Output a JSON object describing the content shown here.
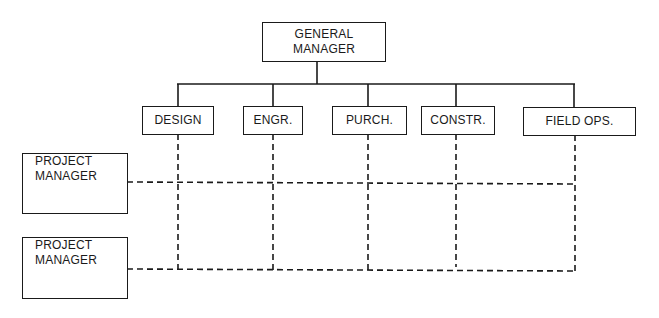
{
  "diagram": {
    "type": "matrix-organization-chart",
    "top": {
      "line1": "GENERAL",
      "line2": "MANAGER"
    },
    "departments": [
      {
        "label": "DESIGN"
      },
      {
        "label": "ENGR."
      },
      {
        "label": "PURCH."
      },
      {
        "label": "CONSTR."
      },
      {
        "label": "FIELD OPS."
      }
    ],
    "projects": [
      {
        "line1": "PROJECT",
        "line2": "MANAGER"
      },
      {
        "line1": "PROJECT",
        "line2": "MANAGER"
      }
    ],
    "colors": {
      "line": "#1a1a1a",
      "background": "#ffffff"
    }
  }
}
